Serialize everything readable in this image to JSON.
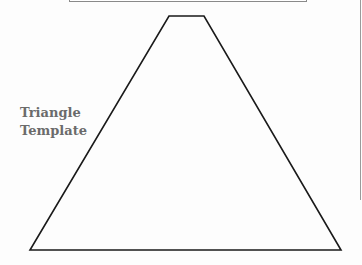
{
  "label": {
    "line1": "Triangle",
    "line2": "Template"
  },
  "shape": {
    "type": "trapezoid-triangle",
    "points": [
      [
        169,
        16
      ],
      [
        204,
        16
      ],
      [
        341,
        250
      ],
      [
        30,
        250
      ]
    ],
    "stroke": "#1a1a1a"
  }
}
